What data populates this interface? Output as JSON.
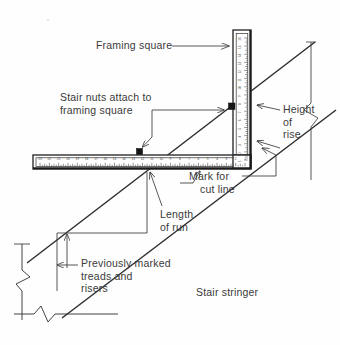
{
  "figure": {
    "background_color": "#fefefe",
    "line_color": "#2f2f2f",
    "text_color": "#3a3a3a"
  },
  "labels": {
    "framing_square": {
      "text": "Framing square",
      "lines": [
        "Framing square"
      ]
    },
    "stair_nuts": {
      "text": "Stair nuts attach to framing square",
      "lines": [
        "Stair nuts attach to",
        "framing square"
      ]
    },
    "height_of_rise": {
      "text": "Height of rise",
      "lines": [
        "Height",
        "of",
        "rise"
      ]
    },
    "mark_for_cut_line": {
      "text": "Mark for cut line",
      "lines": [
        "Mark for",
        "cut line"
      ]
    },
    "length_of_run": {
      "text": "Length of run",
      "lines": [
        "Length",
        "of run"
      ]
    },
    "previously_marked": {
      "text": "Previously marked treads and risers",
      "lines": [
        "Previously marked",
        "treads and",
        "risers"
      ]
    },
    "stair_stringer": {
      "text": "Stair stringer",
      "lines": [
        "Stair stringer"
      ]
    }
  },
  "rulers": {
    "horizontal_blade": {
      "orientation": "horizontal",
      "numbering_direction": "right-to-left",
      "tick_labels": [
        "23",
        "22",
        "21",
        "20",
        "19",
        "18",
        "17",
        "16",
        "15",
        "14",
        "13",
        "12",
        "11",
        "10",
        "9",
        "8",
        "7",
        "6",
        "5",
        "4",
        "3",
        "2",
        "1"
      ],
      "max": 23,
      "min": 1
    },
    "vertical_blade": {
      "orientation": "vertical",
      "numbering_direction": "top-to-bottom",
      "tick_labels": [
        "16",
        "15",
        "14",
        "13",
        "12",
        "11",
        "10",
        "9",
        "8",
        "7",
        "6",
        "5",
        "4",
        "3",
        "2",
        "1"
      ],
      "max": 16,
      "min": 1
    }
  },
  "parts": [
    {
      "name": "framing-square",
      "description": "L-shaped carpenter square with graduated blades"
    },
    {
      "name": "stair-nut-vertical",
      "description": "Stair gauge clamped on vertical blade"
    },
    {
      "name": "stair-nut-horizontal",
      "description": "Stair gauge clamped on horizontal blade"
    },
    {
      "name": "stair-stringer",
      "description": "Sloped stringer board edge"
    },
    {
      "name": "break-symbol-right",
      "description": "Zig-zag break line on right side"
    },
    {
      "name": "break-symbol-left",
      "description": "Zig-zag break line on left side"
    },
    {
      "name": "break-symbol-bottom",
      "description": "Zig-zag break line at bottom"
    }
  ]
}
